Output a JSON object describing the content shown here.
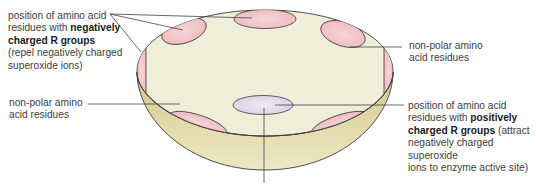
{
  "labels": {
    "negative": {
      "line1": "position of amino acid",
      "line2_prefix": "residues with ",
      "line2_bold": "negatively",
      "line3_bold": "charged R groups",
      "line4": "(repel negatively charged",
      "line5": "superoxide ions)"
    },
    "nonpolar_right": {
      "line1": "non-polar amino",
      "line2": "acid residues"
    },
    "nonpolar_left": {
      "line1": "non-polar amino",
      "line2": "acid residues"
    },
    "positive": {
      "line1": "position of amino acid",
      "line2_prefix": "residues with ",
      "line2_bold": "positively",
      "line3_bold": "charged R groups",
      "line3_suffix": " (attract",
      "line4": "negatively charged superoxide",
      "line5": "ions to enzyme active site)"
    }
  },
  "colors": {
    "bowl_inner": "#efeed8",
    "bowl_outer": "#d6cf98",
    "negative_patch": "#f2c4c8",
    "positive_patch": "#dcd8e6",
    "outline": "#3a3a3a",
    "leader_line": "#444444",
    "text": "#3d3d3d"
  }
}
